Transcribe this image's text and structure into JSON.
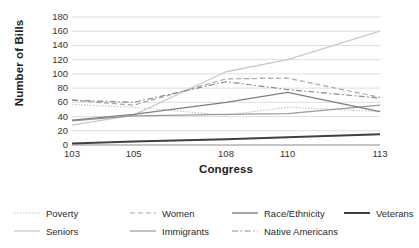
{
  "chart_data": {
    "type": "line",
    "title": "",
    "xlabel": "Congress",
    "ylabel": "Number of Bills",
    "x": [
      103,
      105,
      108,
      110,
      113
    ],
    "categories": [
      "103",
      "105",
      "108",
      "110",
      "113"
    ],
    "xlim": [
      103,
      113
    ],
    "ylim": [
      0,
      180
    ],
    "ytick_step": 20,
    "yticks": [
      "180",
      "160",
      "140",
      "120",
      "100",
      "80",
      "60",
      "40",
      "20",
      "0"
    ],
    "grid": "horizontal",
    "legend_position": "bottom",
    "series": [
      {
        "name": "Poverty",
        "values": [
          57,
          53,
          42,
          53,
          47
        ],
        "style": "dotted",
        "color": "#bfbfbf",
        "width": 1.1
      },
      {
        "name": "Seniors",
        "values": [
          28,
          42,
          103,
          120,
          160
        ],
        "style": "solid",
        "color": "#c9c9c9",
        "width": 1.3
      },
      {
        "name": "Women",
        "values": [
          63,
          56,
          93,
          94,
          67
        ],
        "style": "dashed",
        "color": "#a6a6a6",
        "width": 1.2
      },
      {
        "name": "Immigrants",
        "values": [
          34,
          41,
          43,
          44,
          56
        ],
        "style": "solid",
        "color": "#9a9a9a",
        "width": 1.2
      },
      {
        "name": "Race/Ethnicity",
        "values": [
          35,
          43,
          60,
          74,
          47
        ],
        "style": "solid",
        "color": "#7f7f7f",
        "width": 1.4
      },
      {
        "name": "Native Americans",
        "values": [
          63,
          60,
          89,
          78,
          66
        ],
        "style": "dashdot",
        "color": "#8c8c8c",
        "width": 1.2
      },
      {
        "name": "Veterans",
        "values": [
          2,
          5,
          8,
          11,
          15
        ],
        "style": "solid",
        "color": "#404040",
        "width": 2.0
      }
    ]
  },
  "axes": {
    "y_title": "Number of Bills",
    "x_title": "Congress"
  },
  "colors": {
    "gridline": "#c8c8c8",
    "axis": "#808080",
    "text": "#262626",
    "background": "#ffffff"
  },
  "legend": {
    "items": [
      {
        "label": "Poverty"
      },
      {
        "label": "Women"
      },
      {
        "label": "Race/Ethnicity"
      },
      {
        "label": "Veterans"
      },
      {
        "label": "Seniors"
      },
      {
        "label": "Immigrants"
      },
      {
        "label": "Native Americans"
      }
    ]
  }
}
